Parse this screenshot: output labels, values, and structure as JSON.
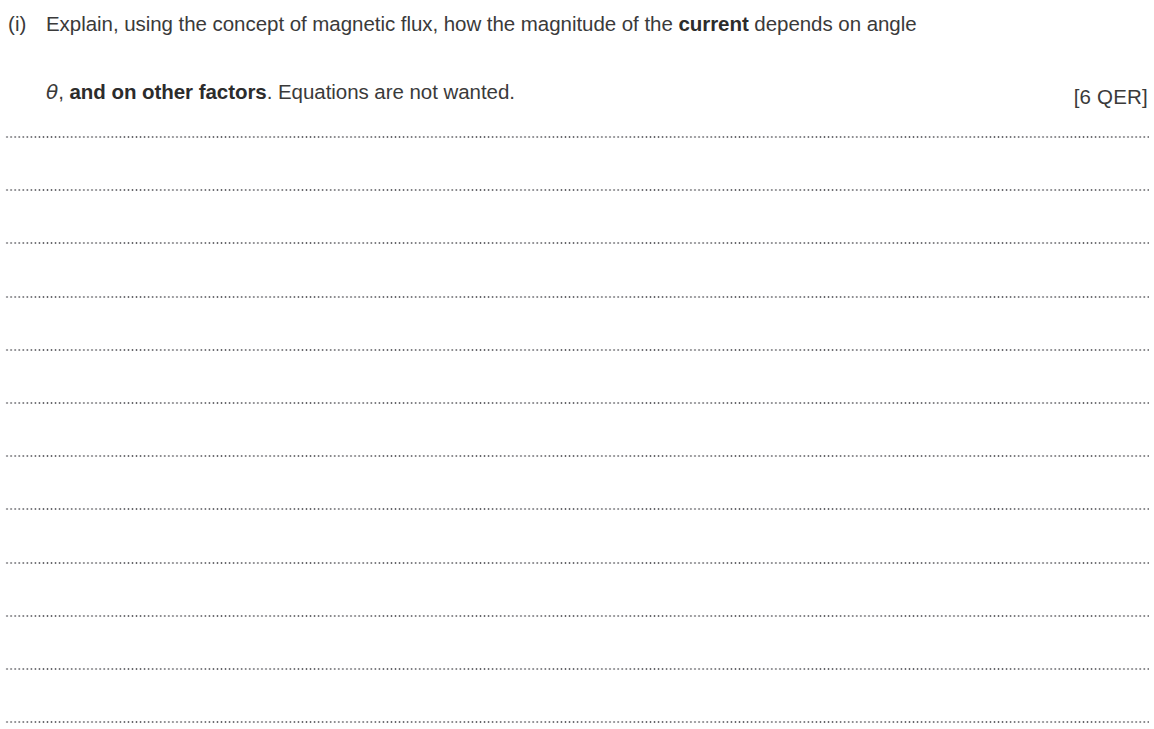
{
  "document": {
    "type": "exam-question",
    "background_color": "#ffffff",
    "text_color": "#3a3a3a"
  },
  "question": {
    "label": "(i)",
    "line1_before_bold": "Explain, using the concept of magnetic flux, how the magnitude of the ",
    "line1_bold": "current",
    "line1_after_bold": " depends on angle",
    "line2_theta": "θ",
    "line2_after_theta": ", ",
    "line2_bold": "and on other factors",
    "line2_tail": ". Equations are not wanted.",
    "marks": "[6 QER]",
    "full_text": "(i) Explain, using the concept of magnetic flux, how the magnitude of the current depends on angle θ, and on other factors. Equations are not wanted. [6 QER]"
  },
  "answer_area": {
    "line_count": 12,
    "line_style": "dotted",
    "lines": [
      {
        "index": 1,
        "value": ""
      },
      {
        "index": 2,
        "value": ""
      },
      {
        "index": 3,
        "value": ""
      },
      {
        "index": 4,
        "value": ""
      },
      {
        "index": 5,
        "value": ""
      },
      {
        "index": 6,
        "value": ""
      },
      {
        "index": 7,
        "value": ""
      },
      {
        "index": 8,
        "value": ""
      },
      {
        "index": 9,
        "value": ""
      },
      {
        "index": 10,
        "value": ""
      },
      {
        "index": 11,
        "value": ""
      },
      {
        "index": 12,
        "value": ""
      }
    ]
  }
}
